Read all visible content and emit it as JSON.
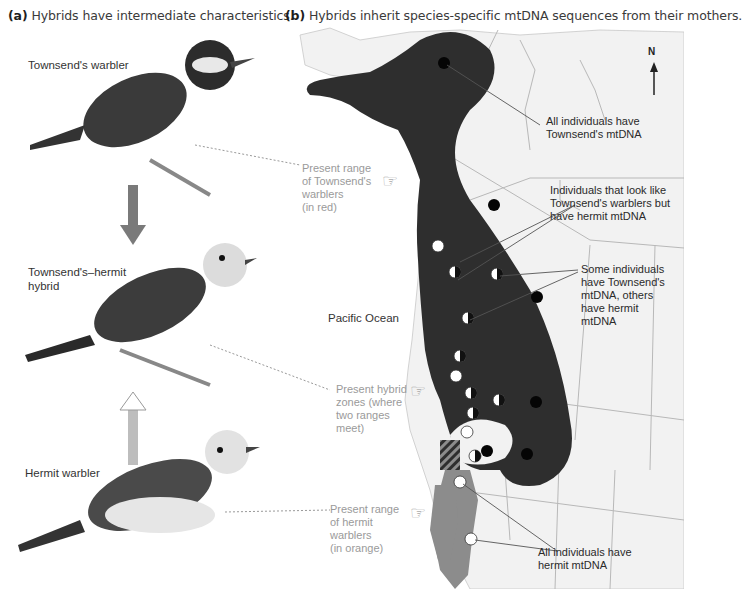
{
  "panel_a": {
    "letter": "(a)",
    "title": "Hybrids have intermediate characteristics.",
    "birds": [
      {
        "label": "Townsend's warbler"
      },
      {
        "label_line1": "Townsend's–hermit",
        "label_line2": "hybrid"
      },
      {
        "label": "Hermit warbler"
      }
    ]
  },
  "panel_b": {
    "letter": "(b)",
    "title": "Hybrids inherit species-specific mtDNA sequences from their mothers.",
    "compass": {
      "label": "N"
    },
    "ocean_label": "Pacific Ocean",
    "callouts": {
      "townsend_range": [
        "Present range",
        "of Townsend's",
        "warblers",
        "(in red)"
      ],
      "hybrid_zones": [
        "Present hybrid",
        "zones (where",
        "two ranges",
        "meet)"
      ],
      "hermit_range": [
        "Present range",
        "of hermit",
        "warblers",
        "(in orange)"
      ]
    },
    "notes": {
      "all_townsend": [
        "All individuals have",
        "Townsend's mtDNA"
      ],
      "look_townsend_hermit": [
        "Individuals that look like",
        "Townsend's warblers but",
        "have hermit mtDNA"
      ],
      "mixed": [
        "Some individuals",
        "have Townsend's",
        "mtDNA, others",
        "have hermit",
        "mtDNA"
      ],
      "all_hermit": [
        "All individuals have",
        "hermit mtDNA"
      ]
    },
    "legend_colors": {
      "townsend_range": "#2e2e2e",
      "hermit_range": "#8c8c8c",
      "land": "#f2f2f2",
      "borders": "#b8b8b8"
    }
  }
}
